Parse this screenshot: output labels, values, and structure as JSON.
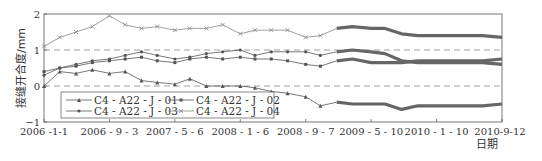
{
  "chart_data": {
    "type": "line",
    "title": "",
    "xlabel": "日期",
    "ylabel": "接缝开合度/mm",
    "ylim": [
      -1,
      2
    ],
    "yticks": [
      -1,
      0,
      1,
      2
    ],
    "xticks": [
      "2006-1-1",
      "2006-9-3",
      "2007-5-6",
      "2008-1-6",
      "2008-9-7",
      "2009-5-10",
      "2010-1-10",
      "2010-9-12"
    ],
    "xtick_labels": [
      "2006 -1-1",
      "2006 - 9 - 3",
      "2007 - 5 - 6",
      "2008 - 1 - 6",
      "2008 - 9 - 7",
      "2009 - 5 - 10",
      "2010 - 1 - 10",
      "2010-9-12"
    ],
    "grid": {
      "horizontal_dashed_at": [
        0,
        1
      ]
    },
    "legend": {
      "position": "lower-left inside",
      "columns": 2
    },
    "x": [
      "2006-1-1",
      "2006-3-1",
      "2006-5-1",
      "2006-7-1",
      "2006-9-3",
      "2006-11-1",
      "2007-1-1",
      "2007-3-1",
      "2007-5-6",
      "2007-7-1",
      "2007-9-1",
      "2007-11-1",
      "2008-1-6",
      "2008-3-1",
      "2008-5-1",
      "2008-7-1",
      "2008-9-7",
      "2008-11-1",
      "2009-1-1",
      "2009-3-1",
      "2009-5-10",
      "2009-7-1",
      "2009-9-1",
      "2009-11-1",
      "2010-1-10",
      "2010-3-1",
      "2010-5-1",
      "2010-7-1",
      "2010-9-12"
    ],
    "series": [
      {
        "name": "C4 - A22 - J - 01",
        "marker": "triangle",
        "values": [
          0.0,
          0.4,
          0.35,
          0.45,
          0.35,
          0.4,
          0.15,
          0.1,
          0.05,
          0.2,
          0.0,
          0.0,
          0.0,
          -0.05,
          -0.15,
          -0.2,
          -0.3,
          -0.55,
          -0.45,
          -0.5,
          -0.5,
          -0.5,
          -0.65,
          -0.55,
          -0.55,
          -0.55,
          -0.55,
          -0.55,
          -0.5
        ]
      },
      {
        "name": "C4 - A22 - J - 02",
        "marker": "square",
        "values": [
          0.4,
          0.5,
          0.55,
          0.65,
          0.7,
          0.75,
          0.8,
          0.7,
          0.65,
          0.75,
          0.8,
          0.75,
          0.8,
          0.75,
          0.75,
          0.7,
          0.6,
          0.55,
          0.7,
          0.75,
          0.65,
          0.65,
          0.65,
          0.7,
          0.7,
          0.7,
          0.7,
          0.7,
          0.75
        ]
      },
      {
        "name": "C4 - A22 - J - 03",
        "marker": "circle",
        "values": [
          0.3,
          0.5,
          0.6,
          0.7,
          0.75,
          0.85,
          0.95,
          0.85,
          0.75,
          0.8,
          0.9,
          0.95,
          1.0,
          0.85,
          0.95,
          0.95,
          0.95,
          0.85,
          0.95,
          1.0,
          0.95,
          0.9,
          0.7,
          0.65,
          0.65,
          0.65,
          0.65,
          0.65,
          0.6
        ]
      },
      {
        "name": "C4 - A22 - J - 04",
        "marker": "x",
        "values": [
          1.1,
          1.35,
          1.5,
          1.65,
          1.95,
          1.7,
          1.6,
          1.65,
          1.55,
          1.6,
          1.6,
          1.7,
          1.45,
          1.55,
          1.55,
          1.55,
          1.35,
          1.4,
          1.6,
          1.65,
          1.6,
          1.6,
          1.45,
          1.4,
          1.4,
          1.4,
          1.4,
          1.4,
          1.35
        ]
      }
    ]
  }
}
